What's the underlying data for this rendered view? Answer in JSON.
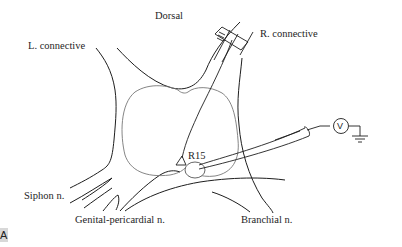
{
  "diagram": {
    "panel_label": "A",
    "labels": {
      "dorsal": "Dorsal",
      "left_connective": "L. connective",
      "right_connective": "R. connective",
      "neuron": "R15",
      "siphon_nerve": "Siphon n.",
      "genital_pericardial_nerve": "Genital-pericardial n.",
      "branchial_nerve": "Branchial n.",
      "voltmeter": "V"
    },
    "colors": {
      "outline": "#1e1e1e",
      "ganglion_inner": "#777777",
      "background": "#ffffff",
      "panel_tag_bg": "#d8d8d8"
    }
  }
}
